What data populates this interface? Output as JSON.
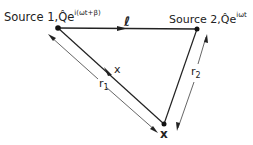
{
  "diagram": {
    "source1": {
      "label": "Source 1,",
      "amplitude": "Q̂e",
      "exponent": "i(ωt+β)"
    },
    "source2": {
      "label": "Source 2,",
      "amplitude": "Q̂e",
      "exponent": "iωt"
    },
    "separation_label": "ℓ",
    "observer_label": "x",
    "path_marker_label": "x",
    "distance1_label": "r",
    "distance1_sub": "1",
    "distance2_label": "r",
    "distance2_sub": "2"
  }
}
